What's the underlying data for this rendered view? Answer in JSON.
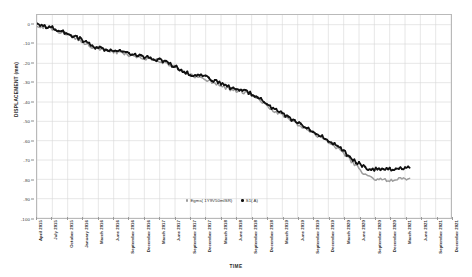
{
  "chart_data": {
    "type": "line",
    "title": "",
    "xlabel": "TIME",
    "ylabel": "DISPLACEMENT (mm)",
    "ylim": [
      -100,
      5
    ],
    "grid": true,
    "legend_position": "bottom-center",
    "y_ticks": [
      "0",
      "-10",
      "-20",
      "-30",
      "-40",
      "-50",
      "-60",
      "-70",
      "-80",
      "-90",
      "-100"
    ],
    "y_tick_values": [
      0,
      -10,
      -20,
      -30,
      -40,
      -50,
      -60,
      -70,
      -80,
      -90,
      -100
    ],
    "categories": [
      "April 2015",
      "July 2015",
      "October 2015",
      "January 2016",
      "March 2016",
      "June 2016",
      "September 2016",
      "December 2016",
      "March 2017",
      "June 2017",
      "September 2017",
      "December 2017",
      "March 2018",
      "June 2018",
      "September 2018",
      "December 2018",
      "March 2019",
      "June 2019",
      "September 2019",
      "December 2019",
      "March 2020",
      "June 2020",
      "September 2020",
      "December 2020",
      "March 2021",
      "June 2021",
      "September 2021",
      "December 2021"
    ],
    "series": [
      {
        "name": "Egms( 1Y9V50mISR)",
        "color": "#9d9d9d",
        "x": [
          0.0,
          0.9,
          1.8,
          2.7,
          3.6,
          4.5,
          5.4,
          6.3,
          7.2,
          8.1,
          9.0,
          9.9,
          10.8,
          11.7,
          12.6,
          13.5,
          14.4,
          15.3,
          16.2,
          17.1,
          18.0,
          18.9,
          19.8,
          20.7,
          21.6,
          22.5,
          23.4,
          24.3
        ],
        "values": [
          -0.5,
          -2.0,
          -4.5,
          -7.5,
          -11.5,
          -13.5,
          -14.5,
          -16.0,
          -17.5,
          -19.0,
          -22.0,
          -26.0,
          -27.5,
          -30.5,
          -33.5,
          -35.0,
          -38.0,
          -44.0,
          -48.0,
          -52.0,
          -56.0,
          -60.0,
          -65.0,
          -72.0,
          -79.0,
          -80.5,
          -80.0,
          -79.5
        ]
      },
      {
        "name": "S1( A)",
        "color": "#111111",
        "x": [
          0.0,
          0.9,
          1.8,
          2.7,
          3.6,
          4.5,
          5.4,
          6.3,
          7.2,
          8.1,
          9.0,
          9.9,
          10.8,
          11.7,
          12.6,
          13.5,
          14.4,
          15.3,
          16.2,
          17.1,
          18.0,
          18.9,
          19.8,
          20.7,
          21.6,
          22.5,
          23.4,
          24.3
        ],
        "values": [
          0.0,
          -1.5,
          -4.0,
          -7.0,
          -11.0,
          -13.0,
          -14.0,
          -15.5,
          -17.0,
          -18.5,
          -21.5,
          -25.5,
          -26.5,
          -29.5,
          -32.5,
          -34.0,
          -37.0,
          -43.0,
          -47.0,
          -51.0,
          -55.0,
          -59.0,
          -64.0,
          -70.5,
          -74.5,
          -75.0,
          -74.5,
          -74.0
        ]
      }
    ]
  },
  "legend": {
    "items": [
      {
        "label": "Egms( 1Y9V50mISR)",
        "color": "#9d9d9d"
      },
      {
        "label": "S1( A)",
        "color": "#111111"
      }
    ]
  },
  "axes": {
    "x_title": "TIME",
    "y_title": "DISPLACEMENT (mm)"
  }
}
